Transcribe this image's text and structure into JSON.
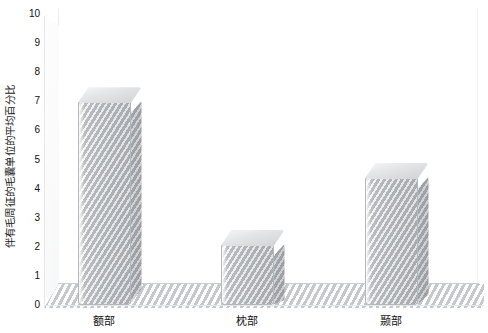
{
  "chart_data": {
    "type": "bar",
    "title": "",
    "subtitle": "",
    "xlabel": "",
    "ylabel": "伴有毛周征的毛囊单位的平均百分比",
    "categories": [
      "额部",
      "枕部",
      "颞部"
    ],
    "values": [
      7.0,
      2.1,
      4.4
    ],
    "series": [
      {
        "name": "伴有毛周征的毛囊单位的平均百分比",
        "values": [
          7.0,
          2.1,
          4.4
        ]
      }
    ],
    "ylim": [
      0,
      10
    ],
    "ytick_labels": [
      "0",
      "1",
      "2",
      "3",
      "4",
      "5",
      "6",
      "7",
      "8",
      "9",
      "10"
    ],
    "ytick_values": [
      0,
      1,
      2,
      3,
      4,
      5,
      6,
      7,
      8,
      9,
      10
    ],
    "grid": false,
    "legend": false,
    "legend_position": "none",
    "style": "3d-bar",
    "bar_color": "#c9cbce",
    "floor_color": "#d7dadd",
    "background_color": "#ffffff",
    "annotations": []
  }
}
